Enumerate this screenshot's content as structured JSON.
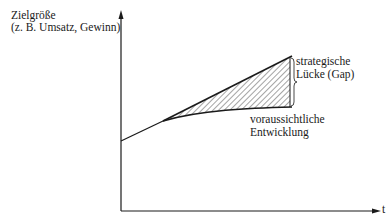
{
  "diagram": {
    "y_axis": {
      "label_line1": "Zielgröße",
      "label_line2": "(z. B. Umsatz, Gewinn)"
    },
    "x_axis": {
      "label": "t"
    },
    "gap": {
      "label_line1": "strategische",
      "label_line2": "Lücke (Gap)"
    },
    "expected": {
      "label_line1": "voraussichtliche",
      "label_line2": "Entwicklung"
    },
    "colors": {
      "ink": "#1a1a1a",
      "background": "#ffffff"
    }
  }
}
